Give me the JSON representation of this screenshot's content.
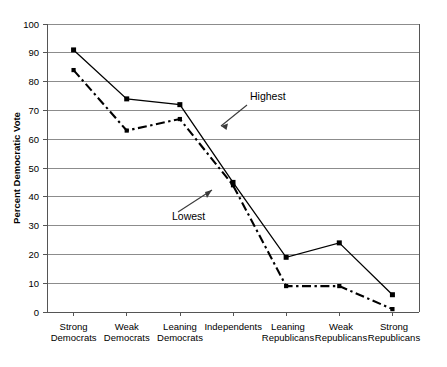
{
  "chart_data": {
    "type": "line",
    "title": "",
    "xlabel": "",
    "ylabel": "Percent Democratic Vote",
    "ylim": [
      0,
      100
    ],
    "ytick_step": 10,
    "grid": true,
    "legend_position": "none (inline annotations)",
    "categories": [
      "Strong Democrats",
      "Weak Democrats",
      "Leaning Democrats",
      "Independents",
      "Leaning Republicans",
      "Weak Republicans",
      "Strong Republicans"
    ],
    "category_lines": [
      [
        "Strong",
        "Democrats"
      ],
      [
        "Weak",
        "Democrats"
      ],
      [
        "Leaning",
        "Democrats"
      ],
      [
        "Independents",
        ""
      ],
      [
        "Leaning",
        "Republicans"
      ],
      [
        "Weak",
        "Republicans"
      ],
      [
        "Strong",
        "Republicans"
      ]
    ],
    "yticks": [
      0,
      10,
      20,
      30,
      40,
      50,
      60,
      70,
      80,
      90,
      100
    ],
    "series": [
      {
        "name": "Highest",
        "style": "solid-with-square-markers",
        "color": "#000000",
        "values": [
          91,
          74,
          72,
          45,
          19,
          24,
          6
        ]
      },
      {
        "name": "Lowest",
        "style": "dash-dot",
        "color": "#000000",
        "values": [
          84,
          63,
          67,
          44,
          9,
          9,
          1
        ]
      }
    ],
    "annotations": [
      {
        "text": "Highest",
        "points_to_series": "Highest"
      },
      {
        "text": "Lowest",
        "points_to_series": "Lowest"
      }
    ]
  },
  "axis": {
    "y_title": "Percent Democratic Vote",
    "y_tick_0": "0",
    "y_tick_10": "10",
    "y_tick_20": "20",
    "y_tick_30": "30",
    "y_tick_40": "40",
    "y_tick_50": "50",
    "y_tick_60": "60",
    "y_tick_70": "70",
    "y_tick_80": "80",
    "y_tick_90": "90",
    "y_tick_100": "100"
  },
  "annotations": {
    "highest": "Highest",
    "lowest": "Lowest"
  },
  "colors": {
    "series": "#000000",
    "gridline": "#808080",
    "background": "#ffffff"
  }
}
